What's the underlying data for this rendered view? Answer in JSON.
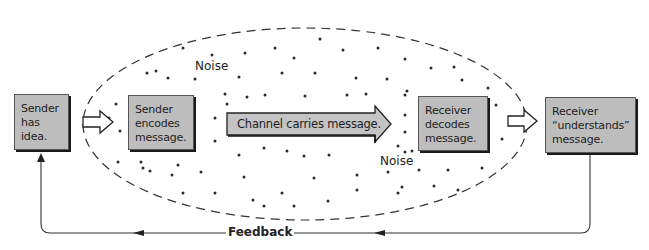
{
  "diagram": {
    "type": "communication-process",
    "nodes": [
      {
        "id": "sender-idea",
        "lines": [
          "Sender",
          "has",
          "idea."
        ]
      },
      {
        "id": "sender-encodes",
        "lines": [
          "Sender",
          "encodes",
          "message."
        ]
      },
      {
        "id": "channel",
        "text": "Channel carries message."
      },
      {
        "id": "receiver-decodes",
        "lines": [
          "Receiver",
          "decodes",
          "message."
        ]
      },
      {
        "id": "receiver-understands",
        "lines": [
          "Receiver",
          "“understands”",
          "message."
        ]
      }
    ],
    "noise_labels": [
      "Noise",
      "Noise"
    ],
    "feedback_label": "Feedback",
    "edges": [
      {
        "from": "sender-idea",
        "to": "sender-encodes",
        "style": "hollow-arrow"
      },
      {
        "from": "sender-encodes",
        "to": "receiver-decodes",
        "style": "channel-arrow"
      },
      {
        "from": "receiver-decodes",
        "to": "receiver-understands",
        "style": "hollow-arrow"
      },
      {
        "from": "receiver-understands",
        "to": "sender-idea",
        "style": "feedback-line",
        "label": "Feedback"
      }
    ],
    "colors": {
      "box_fill": "#bdbdbd",
      "box_border": "#555555",
      "line": "#333333",
      "dots": "#2a2a2a"
    }
  }
}
